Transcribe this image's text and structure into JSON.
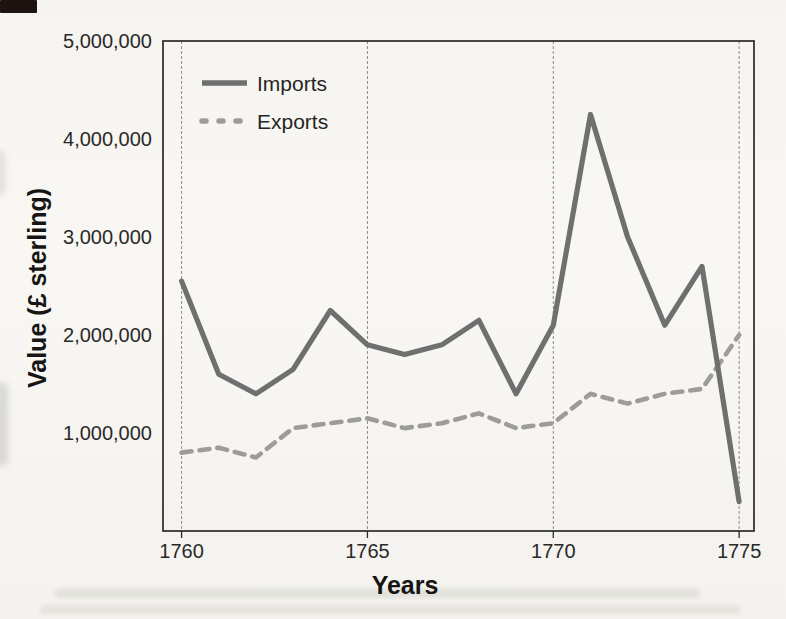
{
  "page": {
    "background": "#f6f5f2"
  },
  "chart_data": {
    "type": "line",
    "title": "",
    "xlabel": "Years",
    "ylabel": "Value (£ sterling)",
    "x": [
      1760,
      1761,
      1762,
      1763,
      1764,
      1765,
      1766,
      1767,
      1768,
      1769,
      1770,
      1771,
      1772,
      1773,
      1774,
      1775
    ],
    "series": [
      {
        "name": "Imports",
        "style": "solid",
        "color": "#6f6f6f",
        "values": [
          2550000,
          1600000,
          1400000,
          1650000,
          2250000,
          1900000,
          1800000,
          1900000,
          2150000,
          1400000,
          2100000,
          4250000,
          3000000,
          2100000,
          2700000,
          300000
        ]
      },
      {
        "name": "Exports",
        "style": "dashed",
        "color": "#9d9c9a",
        "values": [
          800000,
          850000,
          750000,
          1050000,
          1100000,
          1150000,
          1050000,
          1100000,
          1200000,
          1050000,
          1100000,
          1400000,
          1300000,
          1400000,
          1450000,
          2000000
        ]
      }
    ],
    "x_ticks": [
      {
        "value": 1760,
        "label": "1760"
      },
      {
        "value": 1765,
        "label": "1765"
      },
      {
        "value": 1770,
        "label": "1770"
      },
      {
        "value": 1775,
        "label": "1775"
      }
    ],
    "y_ticks": [
      {
        "value": 1000000,
        "label": "1,000,000"
      },
      {
        "value": 2000000,
        "label": "2,000,000"
      },
      {
        "value": 3000000,
        "label": "3,000,000"
      },
      {
        "value": 4000000,
        "label": "4,000,000"
      },
      {
        "value": 5000000,
        "label": "5,000,000"
      }
    ],
    "x_range": [
      1759.5,
      1775.4
    ],
    "y_range": [
      0,
      5000000
    ],
    "grid": "vertical-gridlines-only",
    "legend_position": "top-left-inside",
    "axis_color": "#2b2a28",
    "gridline_color": "#82807c",
    "text_color": "#2a2927"
  }
}
